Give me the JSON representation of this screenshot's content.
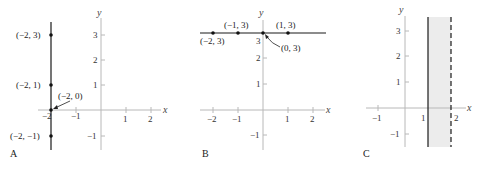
{
  "panels": [
    {
      "id": "A",
      "label": "A",
      "axis_x": "x",
      "axis_y": "y",
      "x_ticks": [
        "−2",
        "−1",
        "1",
        "2"
      ],
      "y_ticks": [
        "3",
        "2",
        "1",
        "−1"
      ],
      "graph": "vertical line x = -2",
      "points": [
        {
          "label": "(−2, 3)"
        },
        {
          "label": "(−2, 1)"
        },
        {
          "label": "(−2, 0)"
        },
        {
          "label": "(−2, −1)"
        }
      ]
    },
    {
      "id": "B",
      "label": "B",
      "axis_x": "x",
      "axis_y": "y",
      "x_ticks": [
        "−2",
        "−1",
        "1",
        "2"
      ],
      "y_ticks": [
        "3",
        "2",
        "1",
        "−1"
      ],
      "graph": "horizontal line y = 3",
      "points": [
        {
          "label": "(−2, 3)"
        },
        {
          "label": "(−1, 3)"
        },
        {
          "label": "(0, 3)"
        },
        {
          "label": "(1, 3)"
        }
      ]
    },
    {
      "id": "C",
      "label": "C",
      "axis_x": "x",
      "axis_y": "y",
      "x_ticks": [
        "−1",
        "1",
        "2"
      ],
      "y_ticks": [
        "3",
        "2",
        "1",
        "−1"
      ],
      "graph": "shaded strip 1 ≤ x < 2 (solid line at x=1, dashed line at x=2)"
    }
  ],
  "colors": {
    "axis": "#b8b8b8",
    "line": "#1a1a1a",
    "shade": "#ececec"
  }
}
